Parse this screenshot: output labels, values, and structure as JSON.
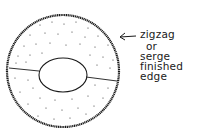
{
  "diagram": {
    "type": "sewing-pattern-sketch",
    "shape": "oval fabric piece with center opening",
    "fill_texture": "stippled dots",
    "seam": "horizontal seam line across piece",
    "annotation": {
      "lines": [
        "zigzag",
        "or",
        "serge",
        "finished",
        "edge"
      ],
      "points_to": "outer edge"
    },
    "colors": {
      "ink": "#1a1a1a",
      "background": "#ffffff"
    }
  }
}
